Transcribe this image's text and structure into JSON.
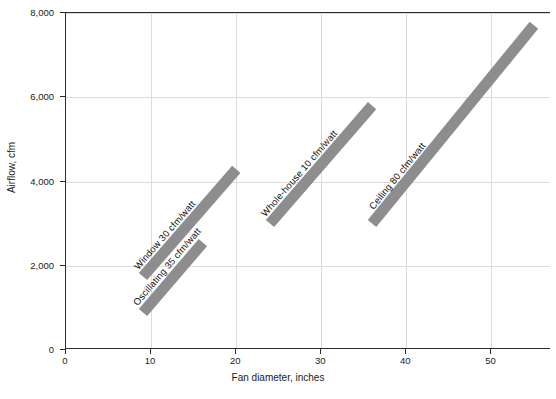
{
  "chart_data": {
    "type": "line",
    "title": "",
    "xlabel": "Fan diameter, inches",
    "ylabel": "Airflow, cfm",
    "xlim": [
      0,
      57
    ],
    "ylim": [
      0,
      8000
    ],
    "xticks": [
      0,
      10,
      20,
      30,
      40,
      50
    ],
    "xtick_labels": [
      "0",
      "10",
      "20",
      "30",
      "40",
      "50"
    ],
    "yticks": [
      0,
      2000,
      4000,
      6000,
      8000
    ],
    "ytick_labels": [
      "0",
      "2,000",
      "4,000",
      "6,000",
      "8,000"
    ],
    "grid": true,
    "legend": "none",
    "band_color": "#8d8d8d",
    "series": [
      {
        "name": "Oscillating 35 cfm/watt",
        "label": "Oscillating 35 cfm/watt",
        "efficacy_cfm_per_watt": 35,
        "x": [
          9,
          16
        ],
        "y": [
          900,
          2550
        ]
      },
      {
        "name": "Window 30 cfm/watt",
        "label": "Window 30 cfm/watt",
        "efficacy_cfm_per_watt": 30,
        "x": [
          9,
          20
        ],
        "y": [
          1750,
          4300
        ]
      },
      {
        "name": "Whole-house 10 cfm/watt",
        "label": "Whole-house 10 cfm/watt",
        "efficacy_cfm_per_watt": 10,
        "x": [
          24,
          36
        ],
        "y": [
          3000,
          5800
        ]
      },
      {
        "name": "Ceiling 80 cfm/watt",
        "label": "Ceiling 80 cfm/watt",
        "efficacy_cfm_per_watt": 80,
        "x": [
          36,
          55
        ],
        "y": [
          3000,
          7700
        ]
      }
    ]
  }
}
